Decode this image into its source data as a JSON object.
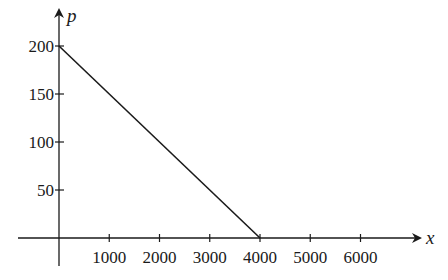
{
  "chart_data": {
    "type": "line",
    "title": "",
    "xlabel": "x",
    "ylabel": "p",
    "x": [
      0,
      4000
    ],
    "series": [
      {
        "name": "p",
        "values": [
          200,
          0
        ]
      }
    ],
    "xticks": [
      1000,
      2000,
      3000,
      4000,
      5000,
      6000
    ],
    "xtick_labels": [
      "1000",
      "2000",
      "3000",
      "4000",
      "5000",
      "6000"
    ],
    "yticks": [
      50,
      100,
      150,
      200
    ],
    "ytick_labels": [
      "50",
      "100",
      "150",
      "200"
    ],
    "xlim": [
      0,
      6500
    ],
    "ylim": [
      0,
      215
    ],
    "grid": false,
    "legend": "none",
    "colors": {
      "line": "#1a1a1a",
      "axis": "#1a1a1a"
    }
  }
}
